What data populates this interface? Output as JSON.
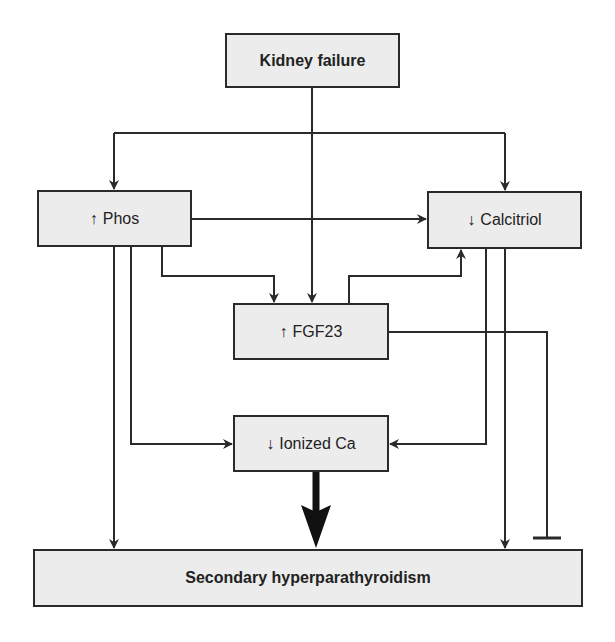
{
  "diagram": {
    "nodes": {
      "kidney_failure": {
        "label": "Kidney failure"
      },
      "phos": {
        "arrow": "↑",
        "label": "Phos"
      },
      "calcitriol": {
        "arrow": "↓",
        "label": "Calcitriol"
      },
      "fgf23": {
        "arrow": "↑",
        "label": "FGF23"
      },
      "ionized_ca": {
        "arrow": "↓",
        "label": "Ionized Ca"
      },
      "secondary_hpt": {
        "label": "Secondary hyperparathyroidism"
      }
    },
    "edges": [
      {
        "from": "kidney_failure",
        "to": "phos",
        "type": "stimulates"
      },
      {
        "from": "kidney_failure",
        "to": "calcitriol",
        "type": "stimulates"
      },
      {
        "from": "kidney_failure",
        "to": "fgf23",
        "type": "stimulates"
      },
      {
        "from": "phos",
        "to": "calcitriol",
        "type": "stimulates"
      },
      {
        "from": "phos",
        "to": "fgf23",
        "type": "stimulates"
      },
      {
        "from": "phos",
        "to": "ionized_ca",
        "type": "stimulates"
      },
      {
        "from": "phos",
        "to": "secondary_hpt",
        "type": "stimulates"
      },
      {
        "from": "fgf23",
        "to": "calcitriol",
        "type": "stimulates"
      },
      {
        "from": "fgf23",
        "to": "secondary_hpt",
        "type": "inhibits"
      },
      {
        "from": "calcitriol",
        "to": "ionized_ca",
        "type": "stimulates"
      },
      {
        "from": "calcitriol",
        "to": "secondary_hpt",
        "type": "stimulates"
      },
      {
        "from": "ionized_ca",
        "to": "secondary_hpt",
        "type": "stimulates-strong"
      }
    ]
  },
  "colors": {
    "box_fill": "#ececec",
    "line": "#2a2a2a"
  }
}
